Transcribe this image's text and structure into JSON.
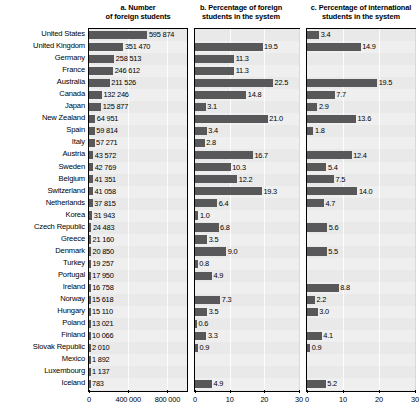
{
  "figure": {
    "countries": [
      "United States",
      "United Kingdom",
      "Germany",
      "France",
      "Australia",
      "Canada",
      "Japan",
      "New Zealand",
      "Spain",
      "Italy",
      "Austria",
      "Sweden",
      "Belgium",
      "Switzerland",
      "Netherlands",
      "Korea",
      "Czech Republic",
      "Greece",
      "Denmark",
      "Turkey",
      "Portugal",
      "Ireland",
      "Norway",
      "Hungary",
      "Poland",
      "Finland",
      "Slovak Republic",
      "Mexico",
      "Luxembourg",
      "Iceland"
    ]
  },
  "chart_data": [
    {
      "type": "bar",
      "panel": "a",
      "title": "a. Number\nof foreign students",
      "title_lines": [
        "a. Number",
        "of foreign students"
      ],
      "orientation": "horizontal",
      "categories": [
        "United States",
        "United Kingdom",
        "Germany",
        "France",
        "Australia",
        "Canada",
        "Japan",
        "New Zealand",
        "Spain",
        "Italy",
        "Austria",
        "Sweden",
        "Belgium",
        "Switzerland",
        "Netherlands",
        "Korea",
        "Czech Republic",
        "Greece",
        "Denmark",
        "Turkey",
        "Portugal",
        "Ireland",
        "Norway",
        "Hungary",
        "Poland",
        "Finland",
        "Slovak Republic",
        "Mexico",
        "Luxembourg",
        "Iceland"
      ],
      "values": [
        595874,
        351470,
        258513,
        246612,
        211526,
        132246,
        125877,
        64951,
        59814,
        57271,
        43572,
        42769,
        41351,
        41058,
        37815,
        31943,
        24483,
        21160,
        20850,
        19257,
        17950,
        16758,
        15618,
        15110,
        13021,
        10066,
        2010,
        1892,
        1137,
        783
      ],
      "value_labels": [
        "595 874",
        "351 470",
        "258 513",
        "246 612",
        "211 526",
        "132 246",
        "125 877",
        "64 951",
        "59 814",
        "57 271",
        "43 572",
        "42 769",
        "41 351",
        "41 058",
        "37 815",
        "31 943",
        "24 483",
        "21 160",
        "20 850",
        "19 257",
        "17 950",
        "16 758",
        "15 618",
        "15 110",
        "13 021",
        "10 066",
        "2 010",
        "1 892",
        "1 137",
        "783"
      ],
      "xlim": [
        0,
        1000000
      ],
      "xticks": [
        0,
        400000,
        800000
      ],
      "xtick_labels": [
        "0",
        "400 000",
        "800 000"
      ],
      "xlabel": "",
      "ylabel": "",
      "grid": true,
      "bar_color": "#58585a"
    },
    {
      "type": "bar",
      "panel": "b",
      "title": "b. Percentage of foreign students in the system",
      "title_lines": [
        "b. Percentage of foreign",
        "students in the system"
      ],
      "orientation": "horizontal",
      "categories": [
        "United States",
        "United Kingdom",
        "Germany",
        "France",
        "Australia",
        "Canada",
        "Japan",
        "New Zealand",
        "Spain",
        "Italy",
        "Austria",
        "Sweden",
        "Belgium",
        "Switzerland",
        "Netherlands",
        "Korea",
        "Czech Republic",
        "Greece",
        "Denmark",
        "Turkey",
        "Portugal",
        "Ireland",
        "Norway",
        "Hungary",
        "Poland",
        "Finland",
        "Slovak Republic",
        "Mexico",
        "Luxembourg",
        "Iceland"
      ],
      "values": [
        null,
        19.5,
        11.3,
        11.3,
        22.5,
        14.8,
        3.1,
        21.0,
        3.4,
        2.8,
        16.7,
        10.3,
        12.2,
        19.3,
        6.4,
        1.0,
        6.8,
        3.5,
        9.0,
        0.8,
        4.9,
        null,
        7.3,
        3.5,
        0.6,
        3.3,
        0.9,
        null,
        null,
        4.9
      ],
      "value_labels": [
        "",
        "19.5",
        "11.3",
        "11.3",
        "22.5",
        "14.8",
        "3.1",
        "21.0",
        "3.4",
        "2.8",
        "16.7",
        "10.3",
        "12.2",
        "19.3",
        "6.4",
        "1.0",
        "6.8",
        "3.5",
        "9.0",
        "0.8",
        "4.9",
        "",
        "7.3",
        "3.5",
        "0.6",
        "3.3",
        "0.9",
        "",
        "",
        "4.9"
      ],
      "notes": {
        "New Zealand": "value label obscured by overlapping bar; approximately 21.0"
      },
      "xlim": [
        0,
        30
      ],
      "xticks": [
        0,
        10,
        20,
        30
      ],
      "xtick_labels": [
        "0",
        "10",
        "20",
        "30"
      ],
      "xlabel": "",
      "ylabel": "",
      "grid": true,
      "bar_color": "#58585a"
    },
    {
      "type": "bar",
      "panel": "c",
      "title": "c. Percentage of international students in the system",
      "title_lines": [
        "c. Percentage of international",
        "students in the system"
      ],
      "orientation": "horizontal",
      "categories": [
        "United States",
        "United Kingdom",
        "Germany",
        "France",
        "Australia",
        "Canada",
        "Japan",
        "New Zealand",
        "Spain",
        "Italy",
        "Austria",
        "Sweden",
        "Belgium",
        "Switzerland",
        "Netherlands",
        "Korea",
        "Czech Republic",
        "Greece",
        "Denmark",
        "Turkey",
        "Portugal",
        "Ireland",
        "Norway",
        "Hungary",
        "Poland",
        "Finland",
        "Slovak Republic",
        "Mexico",
        "Luxembourg",
        "Iceland"
      ],
      "values": [
        3.4,
        14.9,
        null,
        null,
        19.5,
        7.7,
        2.9,
        13.6,
        1.8,
        null,
        12.4,
        5.4,
        7.5,
        14.0,
        4.7,
        null,
        5.6,
        null,
        5.5,
        null,
        null,
        8.8,
        2.2,
        3.0,
        null,
        4.1,
        0.9,
        null,
        null,
        5.2
      ],
      "value_labels": [
        "3.4",
        "14.9",
        "",
        "",
        "19.5",
        "7.7",
        "2.9",
        "13.6",
        "1.8",
        "",
        "12.4",
        "5.4",
        "7.5",
        "14.0",
        "4.7",
        "",
        "5.6",
        "",
        "5.5",
        "",
        "",
        "8.8",
        "2.2",
        "3.0",
        "",
        "4.1",
        "0.9",
        "",
        "",
        "5.2"
      ],
      "xlim": [
        0,
        30
      ],
      "xticks": [
        0,
        10,
        20,
        30
      ],
      "xtick_labels": [
        "0",
        "10",
        "20",
        "30"
      ],
      "xlabel": "",
      "ylabel": "",
      "grid": true,
      "bar_color": "#58585a"
    }
  ]
}
